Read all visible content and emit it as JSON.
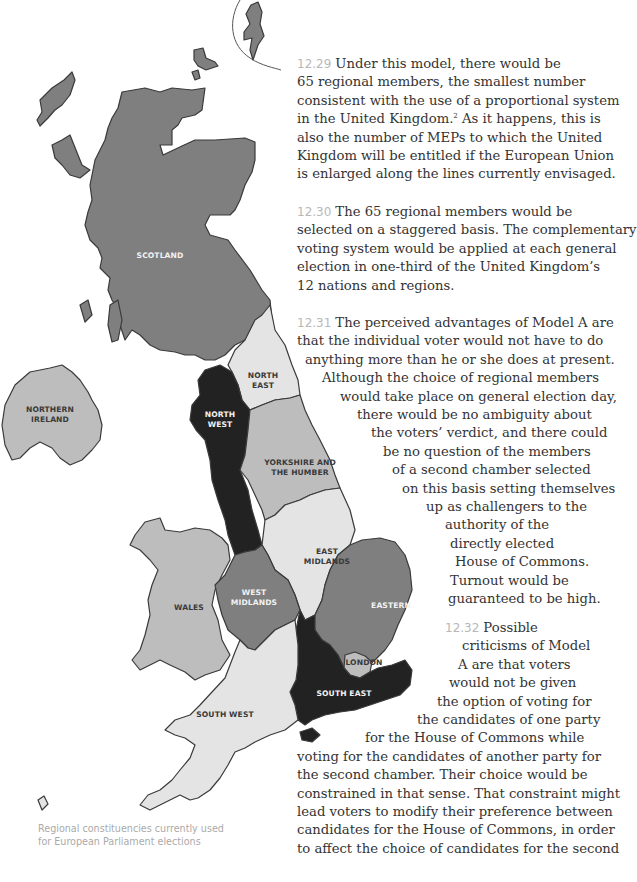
{
  "map": {
    "colors": {
      "dark": "#222222",
      "medium": "#7f7f7f",
      "light": "#bdbdbd",
      "lighter": "#e4e4e4",
      "outline": "#3a3a3a"
    },
    "regions": [
      {
        "id": "scotland",
        "label_lines": [
          "SCOTLAND"
        ],
        "shade": "medium"
      },
      {
        "id": "northern-ireland",
        "label_lines": [
          "NORTHERN",
          "IRELAND"
        ],
        "shade": "light"
      },
      {
        "id": "north-east",
        "label_lines": [
          "NORTH",
          "EAST"
        ],
        "shade": "lighter"
      },
      {
        "id": "north-west",
        "label_lines": [
          "NORTH",
          "WEST"
        ],
        "shade": "dark"
      },
      {
        "id": "yorkshire-and-the-humber",
        "label_lines": [
          "YORKSHIRE AND",
          "THE HUMBER"
        ],
        "shade": "light"
      },
      {
        "id": "east-midlands",
        "label_lines": [
          "EAST",
          "MIDLANDS"
        ],
        "shade": "lighter"
      },
      {
        "id": "west-midlands",
        "label_lines": [
          "WEST",
          "MIDLANDS"
        ],
        "shade": "medium"
      },
      {
        "id": "wales",
        "label_lines": [
          "WALES"
        ],
        "shade": "light"
      },
      {
        "id": "eastern",
        "label_lines": [
          "EASTERN"
        ],
        "shade": "medium"
      },
      {
        "id": "london",
        "label_lines": [
          "LONDON"
        ],
        "shade": "light"
      },
      {
        "id": "south-east",
        "label_lines": [
          "SOUTH EAST"
        ],
        "shade": "dark"
      },
      {
        "id": "south-west",
        "label_lines": [
          "SOUTH WEST"
        ],
        "shade": "lighter"
      }
    ],
    "caption_lines": [
      "Regional constituencies currently used",
      "for European Parliament elections"
    ]
  },
  "paragraphs": [
    {
      "number": "12.29",
      "lines": [
        "Under this model, there would be",
        "65 regional members, the smallest number",
        "consistent with the use of a proportional system",
        "in the United Kingdom.",
        "also the number of MEPs to which the United",
        "Kingdom will be entitled if the European Union",
        "is enlarged along the lines currently envisaged."
      ],
      "footnote_mark": "2",
      "footnote_after": " As it happens, this is"
    },
    {
      "number": "12.30",
      "lines": [
        "The 65 regional members would be",
        "selected on a staggered basis. The complementary",
        "voting system would be applied at each general",
        "election in one-third of the United Kingdom’s",
        "12 nations and regions."
      ]
    },
    {
      "number": "12.31",
      "lines": [
        "The perceived advantages of Model A are",
        "that the individual voter would not have to do",
        "anything more than he or she does at present.",
        "Although the choice of regional members",
        "would take place on general election day,",
        "there would be no ambiguity about",
        "the voters’ verdict, and there could",
        "be no question of the members",
        "of a second chamber selected",
        "on this basis setting themselves",
        "up as challengers to the",
        "authority of the",
        "directly elected",
        "House of Commons.",
        "Turnout would be",
        "guaranteed to be high."
      ]
    },
    {
      "number": "12.32",
      "lines": [
        "Possible",
        "criticisms of Model",
        "A are that voters",
        "would not be given",
        "the option of voting for",
        "the candidates of one party",
        "for the House of Commons while",
        "voting for the candidates of another party for",
        "the second chamber. Their choice would be",
        "constrained in that sense. That constraint might",
        "lead voters to modify their preference between",
        "candidates for the House of Commons, in order",
        "to affect the choice of candidates for the second"
      ]
    }
  ]
}
